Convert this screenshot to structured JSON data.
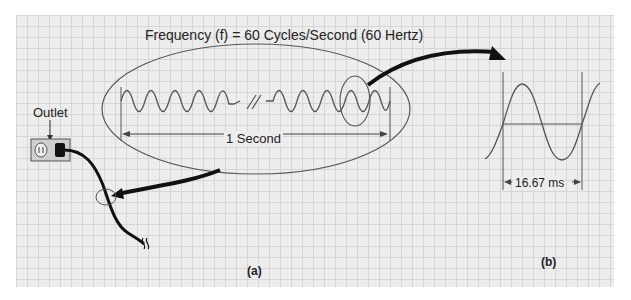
{
  "diagram": {
    "title": "Frequency (f) = 60 Cycles/Second (60 Hertz)",
    "outlet_label": "Outlet",
    "span_label": "1 Second",
    "period_label": "16.67 ms",
    "panel_a": "(a)",
    "panel_b": "(b)",
    "colors": {
      "grid_bg": "#ededed",
      "grid_line": "#d6d6d6",
      "wave": "#555555",
      "cord": "#111111"
    },
    "elements": {
      "outlet": "wall outlet with plug",
      "cord": "power cord with break symbol",
      "ellipse": "zoomed AC waveform view",
      "callout_arrow_a": "arrow from ellipse to cord",
      "callout_arrow_b": "arrow from small circle to single-cycle view"
    }
  }
}
